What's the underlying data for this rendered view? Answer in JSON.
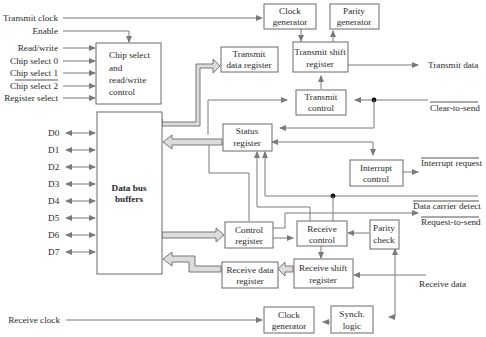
{
  "diagram": {
    "inputs_left": {
      "transmit_clock": "Transmit clock",
      "enable": "Enable",
      "read_write": "Read/write",
      "chip_select_0": "Chip select 0",
      "chip_select_1": "Chip select 1",
      "chip_select_2": "Chip select 2",
      "register_select": "Register select",
      "receive_clock": "Receive clock"
    },
    "data_lines": [
      "D0",
      "D1",
      "D2",
      "D3",
      "D4",
      "D5",
      "D6",
      "D7"
    ],
    "blocks": {
      "chip_select": [
        "Chip select",
        "and",
        "read/write",
        "control"
      ],
      "data_bus_buffers": [
        "Data bus",
        "buffers"
      ],
      "clock_gen_tx": [
        "Clock",
        "generator"
      ],
      "parity_gen": [
        "Parity",
        "generator"
      ],
      "tx_data_reg": [
        "Transmit",
        "data register"
      ],
      "tx_shift_reg": [
        "Transmit shift",
        "register"
      ],
      "tx_control": [
        "Transmit",
        "control"
      ],
      "status_reg": [
        "Status",
        "register"
      ],
      "interrupt_control": [
        "Interrupt",
        "control"
      ],
      "control_reg": [
        "Control",
        "register"
      ],
      "rx_control": [
        "Receive",
        "control"
      ],
      "parity_check": [
        "Parity",
        "check"
      ],
      "rx_data_reg": [
        "Receive data",
        "register"
      ],
      "rx_shift_reg": [
        "Receive shift",
        "register"
      ],
      "clock_gen_rx": [
        "Clock",
        "generator"
      ],
      "synch_logic": [
        "Synch.",
        "logic"
      ]
    },
    "signals_right": {
      "transmit_data": "Transmit data",
      "clear_to_send": "Clear-to-send",
      "interrupt_request": "Interrupt request",
      "data_carrier_detect": "Data carrier detect",
      "request_to_send": "Request-to-send",
      "receive_data": "Receive data"
    }
  }
}
